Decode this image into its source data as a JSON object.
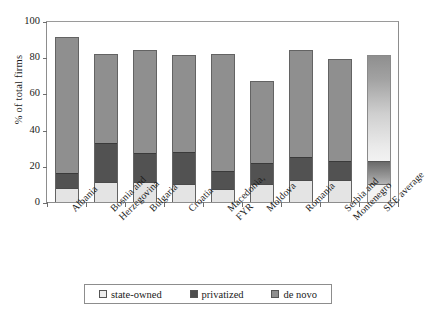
{
  "chart_data": {
    "type": "bar",
    "subtype": "stacked-vertical",
    "title": "",
    "xlabel": "",
    "ylabel": "% of total firms",
    "ylim": [
      0,
      100
    ],
    "yticks": [
      0,
      20,
      40,
      60,
      80,
      100
    ],
    "ytick_labels": [
      "0",
      "20",
      "40",
      "60",
      "80",
      "100"
    ],
    "grid": false,
    "legend_position": "bottom-center",
    "categories": [
      "Albania",
      "Bosnia and Herzegovina",
      "Bulgaria",
      "Croatia",
      "Macedonia, FYR",
      "Moldova",
      "Romania",
      "Serbia and Montenegro",
      "SEE average"
    ],
    "series": [
      {
        "name": "state-owned",
        "color": "#e4e4e4",
        "values": [
          8,
          11,
          11,
          10,
          7,
          10,
          12,
          12,
          10
        ]
      },
      {
        "name": "privatized",
        "color": "#525252",
        "values": [
          8,
          22,
          16,
          18,
          10,
          12,
          13,
          11,
          13
        ]
      },
      {
        "name": "de novo",
        "color": "#8f8f8f",
        "values": [
          75,
          49,
          57,
          53,
          65,
          45,
          59,
          56,
          58
        ]
      }
    ],
    "totals": [
      91,
      82,
      84,
      81,
      82,
      67,
      84,
      79,
      81
    ]
  },
  "legend": {
    "items": [
      {
        "label": "state-owned",
        "swatch": "swatch-state-owned"
      },
      {
        "label": "privatized",
        "swatch": "swatch-privatized"
      },
      {
        "label": "de novo",
        "swatch": "swatch-de-novo"
      }
    ]
  }
}
